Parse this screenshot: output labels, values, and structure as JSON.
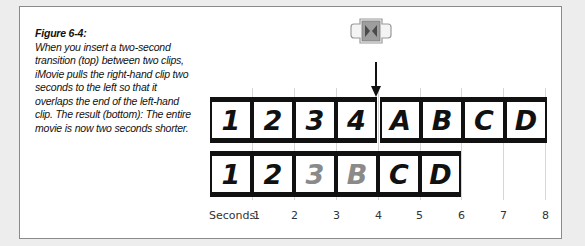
{
  "figure": {
    "title": "Figure 6-4:",
    "caption": "When you insert a two-second transition (top) between two clips, iMovie pulls the right-hand clip two seconds to the left so that it overlaps the end of the left-hand clip. The result (bottom): The entire movie is now two seconds shorter."
  },
  "transition_icon": {
    "name": "cross-dissolve-transition",
    "fill": "#9e9e9e",
    "glyph_color": "#4a4a4a"
  },
  "timeline": {
    "axis_label": "Seconds:",
    "ticks": [
      "1",
      "2",
      "3",
      "4",
      "5",
      "6",
      "7",
      "8"
    ],
    "seconds_px": 42,
    "origin_x": 210,
    "top_row": {
      "description": "before transition",
      "clips": [
        {
          "label": "1",
          "faded": false
        },
        {
          "label": "2",
          "faded": false
        },
        {
          "label": "3",
          "faded": false
        },
        {
          "label": "4",
          "faded": false
        },
        {
          "label": "A",
          "faded": false
        },
        {
          "label": "B",
          "faded": false
        },
        {
          "label": "C",
          "faded": false
        },
        {
          "label": "D",
          "faded": false
        }
      ]
    },
    "bottom_row": {
      "description": "after transition",
      "clips": [
        {
          "label": "1",
          "faded": false
        },
        {
          "label": "2",
          "faded": false
        },
        {
          "label": "3",
          "faded": true
        },
        {
          "label": "B",
          "faded": true
        },
        {
          "label": "C",
          "faded": false
        },
        {
          "label": "D",
          "faded": false
        }
      ]
    }
  }
}
